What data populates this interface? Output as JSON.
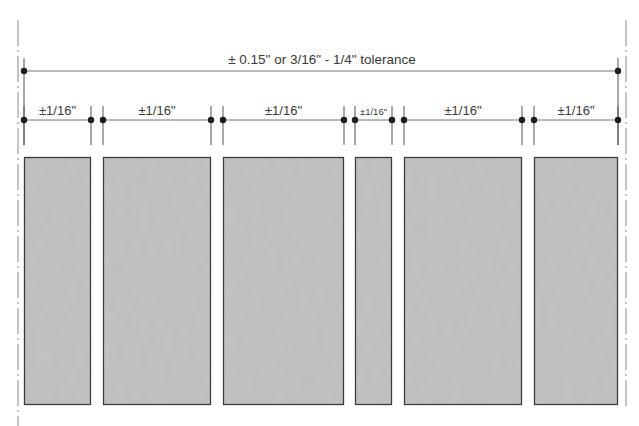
{
  "diagram": {
    "overall_tolerance_label": "± 0.15\" or 3/16\" - 1/4\" tolerance",
    "colors": {
      "line": "#555555",
      "dot": "#1e1e1e",
      "panel_fill": "#bdbdbd",
      "panel_border": "#3c3c3c",
      "centerline": "#8a8a8a",
      "text": "#3a3a3a"
    },
    "panels": [
      {
        "id": 1,
        "x1": 24,
        "x2": 91,
        "tolerance_label": "±1/16\""
      },
      {
        "id": 2,
        "x1": 103,
        "x2": 211,
        "tolerance_label": "±1/16\""
      },
      {
        "id": 3,
        "x1": 223,
        "x2": 344,
        "tolerance_label": "±1/16\""
      },
      {
        "id": 4,
        "x1": 355,
        "x2": 392,
        "tolerance_label": "±1/16\""
      },
      {
        "id": 5,
        "x1": 404,
        "x2": 522,
        "tolerance_label": "±1/16\""
      },
      {
        "id": 6,
        "x1": 534,
        "x2": 618,
        "tolerance_label": "±1/16\""
      }
    ]
  }
}
